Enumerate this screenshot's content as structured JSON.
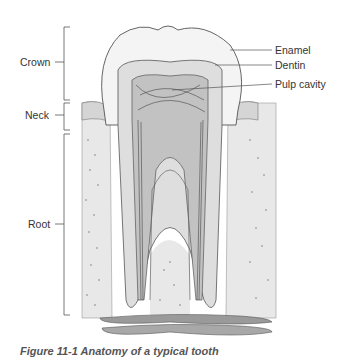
{
  "figure": {
    "title": "Anatomy of a typical tooth",
    "caption": "Figure 11-1 Anatomy of a typical tooth",
    "colors": {
      "line": "#555555",
      "bone": "#e6e6e6",
      "enamel": "#f4f4f4",
      "dentin": "#d9d9d9",
      "pulp": "#bdbdbd",
      "background": "#ffffff"
    }
  },
  "left_labels": [
    {
      "label": "Crown"
    },
    {
      "label": "Neck"
    },
    {
      "label": "Root"
    }
  ],
  "right_labels": [
    {
      "label": "Enamel"
    },
    {
      "label": "Dentin"
    },
    {
      "label": "Pulp cavity"
    }
  ]
}
